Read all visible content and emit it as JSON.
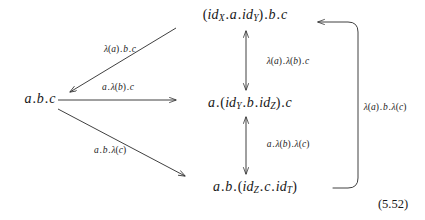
{
  "figure": {
    "kind": "commutative-diagram",
    "equation_number": "(5.52)",
    "ink_color": "#232323",
    "background_color": "#ffffff"
  },
  "nodes": [
    {
      "id": "top",
      "text": "(idX . a . idY) . b . c",
      "x": 245,
      "y": 16
    },
    {
      "id": "left",
      "text": "a . b . c",
      "x": 40,
      "y": 99
    },
    {
      "id": "center",
      "text": "a . (idY . b . idZ) . c",
      "x": 250,
      "y": 104
    },
    {
      "id": "bottom",
      "text": "a . b . (idZ . c . idT)",
      "x": 255,
      "y": 188
    }
  ],
  "edges": [
    {
      "id": "top-to-left",
      "label": "λ(a).b.c",
      "from": "top",
      "to": "left",
      "arrowheads": "to",
      "label_x": 120,
      "label_y": 50
    },
    {
      "id": "left-to-center",
      "label": "a.λ(b).c",
      "from": "left",
      "to": "center",
      "arrowheads": "to",
      "label_x": 118,
      "label_y": 88
    },
    {
      "id": "left-to-bottom",
      "label": "a.b.λ(c)",
      "from": "left",
      "to": "bottom",
      "arrowheads": "to",
      "label_x": 110,
      "label_y": 151
    },
    {
      "id": "top-center-vertical",
      "label": "λ(a).λ(b).c",
      "from": "top",
      "to": "center",
      "arrowheads": "both",
      "label_x": 288,
      "label_y": 62
    },
    {
      "id": "center-bottom-vertical",
      "label": "a.λ(b).λ(c)",
      "from": "center",
      "to": "bottom",
      "arrowheads": "both",
      "label_x": 288,
      "label_y": 145
    },
    {
      "id": "bottom-to-top-bracket",
      "label": "λ(a).b.λ(c)",
      "from": "bottom",
      "to": "top",
      "arrowheads": "both",
      "label_x": 385,
      "label_y": 108
    }
  ],
  "equation": {
    "number": "(5.52)",
    "x": 393,
    "y": 204
  }
}
